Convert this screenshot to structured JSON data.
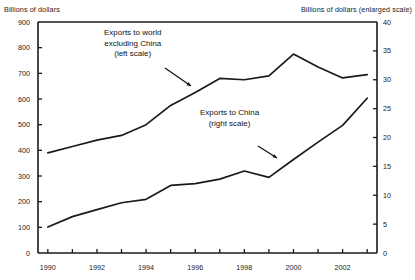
{
  "axes": {
    "left_header": "Billions of dollars",
    "right_header": "Billions of dollars (enlarged scale)",
    "left_ticks": [
      "900",
      "800",
      "700",
      "600",
      "500",
      "400",
      "300",
      "200",
      "100",
      "0"
    ],
    "right_ticks": [
      "40",
      "35",
      "30",
      "25",
      "20",
      "15",
      "10",
      "5",
      "0"
    ],
    "x_ticks": [
      "1990",
      "1992",
      "1994",
      "1996",
      "1998",
      "2000",
      "2002"
    ]
  },
  "annotations": {
    "world": {
      "line1": "Exports to world",
      "line2": "excluding China",
      "line3": "(left scale)"
    },
    "china": {
      "line1": "Exports to China",
      "line2": "(right scale)"
    }
  },
  "chart_data": {
    "type": "line",
    "title": "",
    "xlabel": "",
    "ylabel": "Billions of dollars",
    "y2label": "Billions of dollars (enlarged scale)",
    "x": [
      1990,
      1991,
      1992,
      1993,
      1994,
      1995,
      1996,
      1997,
      1998,
      1999,
      2000,
      2001,
      2002,
      2003
    ],
    "xlim": [
      1989.6,
      2003.4
    ],
    "ylim": [
      0,
      900
    ],
    "y2lim": [
      0,
      40
    ],
    "grid": false,
    "legend": "annotations-on-plot",
    "series": [
      {
        "name": "Exports to world excluding China (left scale)",
        "axis": "left",
        "color": "#1a1a1a",
        "values": [
          390,
          415,
          440,
          458,
          500,
          575,
          625,
          680,
          675,
          690,
          775,
          725,
          682,
          695
        ]
      },
      {
        "name": "Exports to China (right scale)",
        "axis": "right",
        "color": "#1a1a1a",
        "values": [
          4.5,
          6.3,
          7.5,
          8.7,
          9.3,
          11.7,
          12.0,
          12.8,
          14.2,
          13.1,
          16.2,
          19.2,
          22.1,
          26.8
        ]
      }
    ]
  }
}
